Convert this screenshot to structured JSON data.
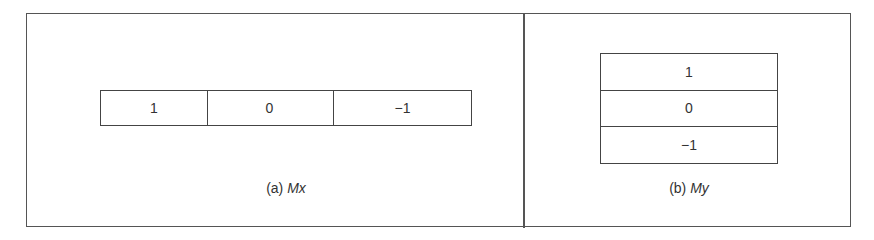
{
  "figure": {
    "panel_a": {
      "caption_prefix": "(a)",
      "caption_name": "Mx",
      "orientation": "horizontal",
      "cells": [
        "1",
        "0",
        "−1"
      ]
    },
    "panel_b": {
      "caption_prefix": "(b)",
      "caption_name": "My",
      "orientation": "vertical",
      "cells": [
        "1",
        "0",
        "−1"
      ]
    }
  }
}
